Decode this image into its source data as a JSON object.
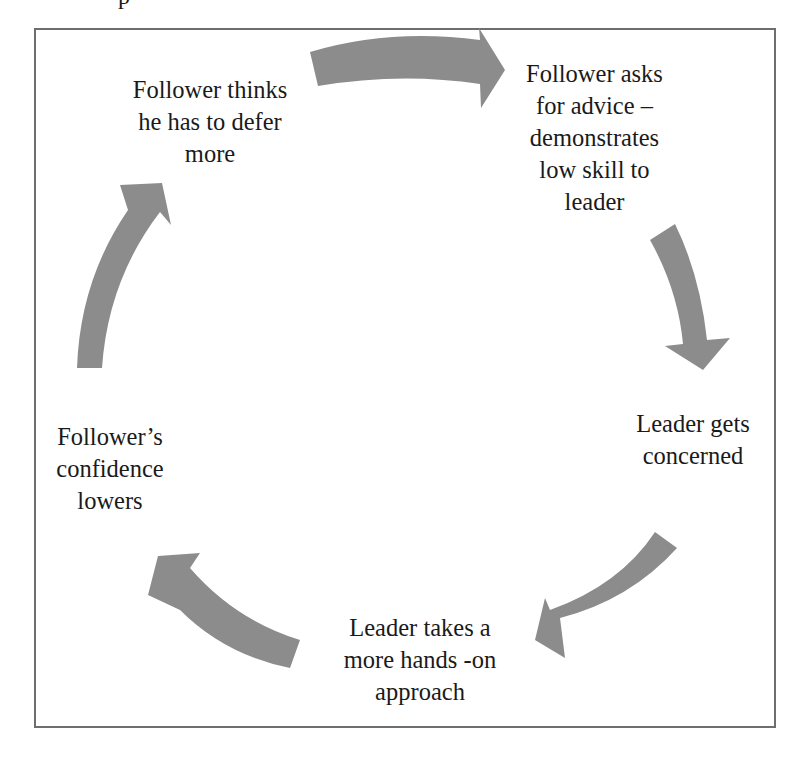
{
  "diagram": {
    "type": "cycle",
    "title_fragment": "p",
    "arrow_color": "#8c8c8c",
    "border_color": "#6e6e6e",
    "nodes": [
      {
        "id": "n1",
        "label": "Follower thinks\nhe has to defer\nmore"
      },
      {
        "id": "n2",
        "label": "Follower asks\nfor advice –\ndemonstrates\nlow skill to\nleader"
      },
      {
        "id": "n3",
        "label": "Leader gets\nconcerned"
      },
      {
        "id": "n4",
        "label": "Leader takes a\nmore hands -on\napproach"
      },
      {
        "id": "n5",
        "label": "Follower’s\nconfidence\nlowers"
      }
    ],
    "edges": [
      {
        "from": "n1",
        "to": "n2"
      },
      {
        "from": "n2",
        "to": "n3"
      },
      {
        "from": "n3",
        "to": "n4"
      },
      {
        "from": "n4",
        "to": "n5"
      },
      {
        "from": "n5",
        "to": "n1"
      }
    ]
  }
}
